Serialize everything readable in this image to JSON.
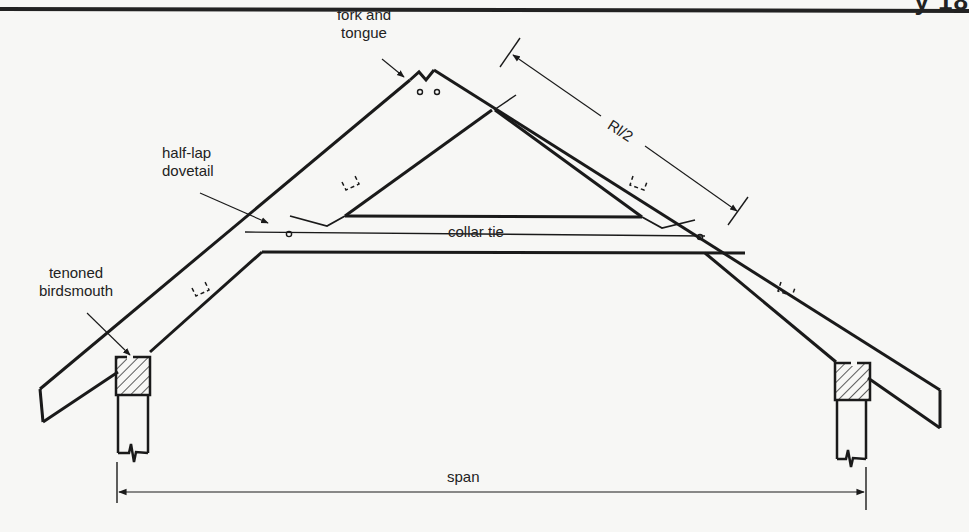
{
  "page": {
    "header_fragment": "y  18",
    "rule_color": "#222222",
    "background": "#f7f7f5"
  },
  "figure": {
    "type": "roof rafter framing diagram",
    "labels": {
      "fork_and_tongue_line1": "fork and",
      "fork_and_tongue_line2": "tongue",
      "rafter_half_length": "Rl/2",
      "half_lap_dovetail_line1": "half-lap",
      "half_lap_dovetail_line2": "dovetail",
      "collar_tie": "collar tie",
      "tenoned_birdsmouth_line1": "tenoned",
      "tenoned_birdsmouth_line2": "birdsmouth",
      "span": "span"
    },
    "components": [
      "left rafter",
      "right rafter",
      "collar tie",
      "apex fork and tongue joint",
      "half-lap dovetail joints",
      "left wall plate (hatched)",
      "right wall plate (hatched)",
      "left wall post",
      "right wall post",
      "span dimension line",
      "Rl/2 dimension line"
    ],
    "line_color": "#1a1a1a",
    "hatch_color": "#333333"
  }
}
